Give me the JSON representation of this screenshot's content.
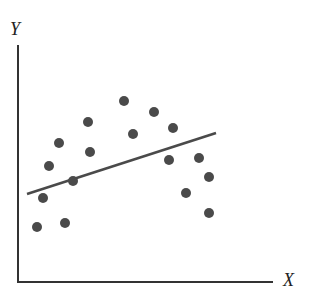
{
  "chart_data": {
    "type": "scatter",
    "title": "",
    "xlabel": "X",
    "ylabel": "Y",
    "grid": false,
    "legend": null,
    "xlim": [
      0,
      255
    ],
    "ylim": [
      0,
      237
    ],
    "ticks": {
      "x": [],
      "y": []
    },
    "series": [
      {
        "name": "observations",
        "points": [
          {
            "x": 19,
            "y": 55
          },
          {
            "x": 25,
            "y": 84
          },
          {
            "x": 31,
            "y": 116
          },
          {
            "x": 41,
            "y": 139
          },
          {
            "x": 47,
            "y": 59
          },
          {
            "x": 55,
            "y": 101
          },
          {
            "x": 70,
            "y": 160
          },
          {
            "x": 72,
            "y": 130
          },
          {
            "x": 106,
            "y": 181
          },
          {
            "x": 115,
            "y": 148
          },
          {
            "x": 136,
            "y": 170
          },
          {
            "x": 155,
            "y": 154
          },
          {
            "x": 151,
            "y": 122
          },
          {
            "x": 181,
            "y": 124
          },
          {
            "x": 191,
            "y": 105
          },
          {
            "x": 168,
            "y": 89
          },
          {
            "x": 191,
            "y": 69
          }
        ]
      }
    ],
    "fit_line": {
      "name": "regression line",
      "x": [
        9,
        198
      ],
      "y": [
        88,
        149
      ]
    },
    "colors": {
      "points": "#4a4a4a",
      "line": "#4a4a4a",
      "axes": "#333333"
    }
  },
  "labels": {
    "x_axis": "X",
    "y_axis": "Y"
  }
}
